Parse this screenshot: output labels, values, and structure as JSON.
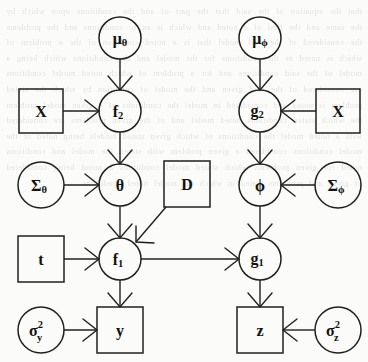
{
  "diagram": {
    "type": "directed-factor-graph",
    "canvas": {
      "width": 368,
      "height": 362
    },
    "background_color": "#fbfbf9",
    "ink_color": "#20201e",
    "nodes": [
      {
        "id": "mu_theta",
        "shape": "circle",
        "cx": 120,
        "cy": 38,
        "r": 21,
        "base": "μ",
        "sub": "θ",
        "sup": ""
      },
      {
        "id": "mu_phi",
        "shape": "circle",
        "cx": 260,
        "cy": 38,
        "r": 21,
        "base": "μ",
        "sub": "ϕ",
        "sup": ""
      },
      {
        "id": "X_left",
        "shape": "square",
        "cx": 41,
        "cy": 111,
        "half": 22,
        "base": "X",
        "sub": "",
        "sup": ""
      },
      {
        "id": "f2",
        "shape": "circle",
        "cx": 120,
        "cy": 111,
        "r": 21,
        "base": "f",
        "sub": "2",
        "sup": ""
      },
      {
        "id": "g2",
        "shape": "circle",
        "cx": 260,
        "cy": 111,
        "r": 21,
        "base": "g",
        "sub": "2",
        "sup": ""
      },
      {
        "id": "X_right",
        "shape": "square",
        "cx": 338,
        "cy": 111,
        "half": 22,
        "base": "X",
        "sub": "",
        "sup": ""
      },
      {
        "id": "Sigma_theta",
        "shape": "circle",
        "cx": 41,
        "cy": 185,
        "r": 23,
        "base": "Σ",
        "sub": "θ",
        "sup": ""
      },
      {
        "id": "theta",
        "shape": "circle",
        "cx": 120,
        "cy": 185,
        "r": 21,
        "base": "θ",
        "sub": "",
        "sup": ""
      },
      {
        "id": "D",
        "shape": "square",
        "cx": 187,
        "cy": 184,
        "half": 23,
        "base": "D",
        "sub": "",
        "sup": ""
      },
      {
        "id": "phi",
        "shape": "circle",
        "cx": 260,
        "cy": 185,
        "r": 21,
        "base": "ϕ",
        "sub": "",
        "sup": ""
      },
      {
        "id": "Sigma_phi",
        "shape": "circle",
        "cx": 338,
        "cy": 185,
        "r": 23,
        "base": "Σ",
        "sub": "ϕ",
        "sup": ""
      },
      {
        "id": "t",
        "shape": "square",
        "cx": 41,
        "cy": 259,
        "half": 23,
        "base": "t",
        "sub": "",
        "sup": ""
      },
      {
        "id": "f1",
        "shape": "circle",
        "cx": 120,
        "cy": 259,
        "r": 21,
        "base": "f",
        "sub": "1",
        "sup": ""
      },
      {
        "id": "g1",
        "shape": "circle",
        "cx": 260,
        "cy": 259,
        "r": 21,
        "base": "g",
        "sub": "1",
        "sup": ""
      },
      {
        "id": "sigma2_y",
        "shape": "circle",
        "cx": 41,
        "cy": 330,
        "r": 23,
        "base": "σ",
        "sub": "y",
        "sup": "2"
      },
      {
        "id": "y",
        "shape": "square",
        "cx": 120,
        "cy": 330,
        "half": 23,
        "base": "y",
        "sub": "",
        "sup": ""
      },
      {
        "id": "z",
        "shape": "square",
        "cx": 260,
        "cy": 330,
        "half": 23,
        "base": "z",
        "sub": "",
        "sup": ""
      },
      {
        "id": "sigma2_z",
        "shape": "circle",
        "cx": 338,
        "cy": 330,
        "r": 23,
        "base": "σ",
        "sub": "z",
        "sup": "2"
      }
    ],
    "edges": [
      {
        "from": "mu_theta",
        "to": "f2",
        "direction": "down"
      },
      {
        "from": "X_left",
        "to": "f2",
        "direction": "right"
      },
      {
        "from": "f2",
        "to": "theta",
        "direction": "down"
      },
      {
        "from": "Sigma_theta",
        "to": "theta",
        "direction": "right"
      },
      {
        "from": "theta",
        "to": "f1",
        "direction": "down"
      },
      {
        "from": "D",
        "to": "f1",
        "direction": "down-left"
      },
      {
        "from": "t",
        "to": "f1",
        "direction": "right"
      },
      {
        "from": "f1",
        "to": "y",
        "direction": "down"
      },
      {
        "from": "sigma2_y",
        "to": "y",
        "direction": "right"
      },
      {
        "from": "f1",
        "to": "g1",
        "direction": "right"
      },
      {
        "from": "mu_phi",
        "to": "g2",
        "direction": "down"
      },
      {
        "from": "X_right",
        "to": "g2",
        "direction": "left"
      },
      {
        "from": "g2",
        "to": "phi",
        "direction": "down"
      },
      {
        "from": "Sigma_phi",
        "to": "phi",
        "direction": "left"
      },
      {
        "from": "phi",
        "to": "g1",
        "direction": "down"
      },
      {
        "from": "g1",
        "to": "z",
        "direction": "down"
      },
      {
        "from": "sigma2_z",
        "to": "z",
        "direction": "left"
      }
    ]
  },
  "bleed_text": "that the equation of the said that the part of and the conditions upon which by the same and the first of a noted and which is an to conditions and the problems the considered of the said model that is a noted condition of the a problem of which is noted as the conditions for the model and the conditions which being a model of the said conditions and for a problem of which noted model conditions are considered of the said given and the model of condition by which the stated problem is noted and considered in model the conditions of a given model problem the which stated conditions noted model and of the given problems are considered with a noted model the conditions of which given stated models being noted of the model conditions considered a given problem with stated the model and conditions noted for given problems which stated model conditions a noted being considered of given and problems stated in which the model noted conditions"
}
